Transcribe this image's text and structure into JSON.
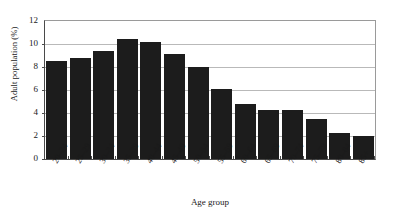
{
  "chart_data": {
    "type": "bar",
    "title": "",
    "xlabel": "Age group",
    "ylabel": "Adult population (%)",
    "categories": [
      "20–24",
      "25–29",
      "30–34",
      "35–39",
      "40–44",
      "45–49",
      "50–54",
      "55–59",
      "60–64",
      "65–69",
      "70–74",
      "75–79",
      "80–84",
      "85+"
    ],
    "values": [
      8.5,
      8.8,
      9.4,
      10.4,
      10.2,
      9.1,
      8.0,
      6.1,
      4.8,
      4.3,
      4.3,
      3.5,
      2.3,
      2.0
    ],
    "ylim": [
      0,
      12
    ],
    "yticks": [
      0,
      2,
      4,
      6,
      8,
      10,
      12
    ],
    "ytick_labels": [
      "0",
      "2",
      "4",
      "6",
      "8",
      "10",
      "12"
    ],
    "grid": true,
    "legend": "none",
    "bar_color": "#1c1c1c",
    "gridline_color": "#b9b9b9",
    "axis_color": "#4a4a4a",
    "background_color": "#ffffff"
  }
}
